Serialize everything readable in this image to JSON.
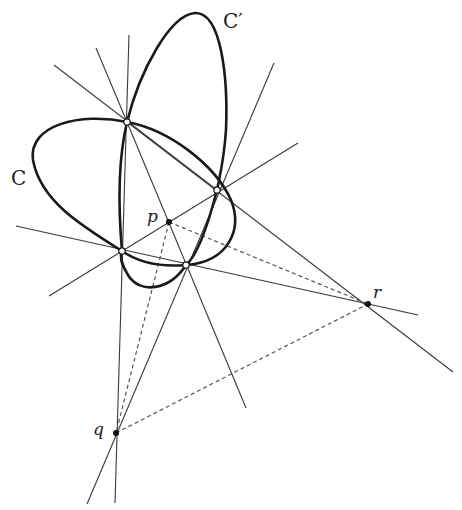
{
  "diagram": {
    "colors": {
      "curve": "#1a1a1a",
      "line": "#3a3a3a",
      "dashed": "#555555",
      "point_fill": "#111111",
      "open_point_fill": "#ffffff"
    },
    "labels": {
      "C": "C",
      "C_prime": "C′",
      "p": "p",
      "q": "q",
      "r": "r"
    },
    "intersection_points": [
      {
        "id": "A",
        "x": 127,
        "y": 122
      },
      {
        "id": "B",
        "x": 217,
        "y": 190
      },
      {
        "id": "D",
        "x": 122,
        "y": 251
      },
      {
        "id": "E",
        "x": 186,
        "y": 265
      }
    ],
    "diagonal_points": [
      {
        "id": "p",
        "x": 169,
        "y": 222
      },
      {
        "id": "q",
        "x": 116,
        "y": 433
      },
      {
        "id": "r",
        "x": 368,
        "y": 304
      }
    ],
    "lines": [
      {
        "name": "line-A-upleft",
        "x1": 54,
        "y1": 65,
        "x2": 217,
        "y2": 190
      },
      {
        "name": "line-A-up",
        "x1": 96,
        "y1": 48,
        "x2": 127,
        "y2": 122
      },
      {
        "name": "line-AD-q",
        "x1": 129,
        "y1": 35,
        "x2": 115,
        "y2": 503
      },
      {
        "name": "line-AB-r",
        "x1": 127,
        "y1": 122,
        "x2": 453,
        "y2": 372
      },
      {
        "name": "line-AE",
        "x1": 127,
        "y1": 122,
        "x2": 246,
        "y2": 408
      },
      {
        "name": "line-BD",
        "x1": 49,
        "y1": 296,
        "x2": 298,
        "y2": 143
      },
      {
        "name": "line-DE-r",
        "x1": 16,
        "y1": 226,
        "x2": 418,
        "y2": 315
      },
      {
        "name": "line-BE-q",
        "x1": 274,
        "y1": 63,
        "x2": 87,
        "y2": 504
      }
    ],
    "dashed_lines": [
      {
        "name": "dashed-pq",
        "x1": 169,
        "y1": 222,
        "x2": 116,
        "y2": 433
      },
      {
        "name": "dashed-pr",
        "x1": 169,
        "y1": 222,
        "x2": 368,
        "y2": 304
      },
      {
        "name": "dashed-qr",
        "x1": 116,
        "y1": 433,
        "x2": 368,
        "y2": 304
      }
    ]
  }
}
